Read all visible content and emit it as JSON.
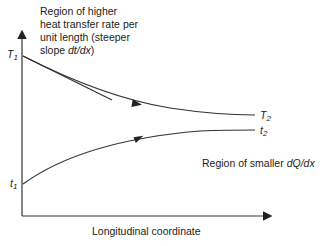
{
  "diagram": {
    "annotation_top": {
      "lines": [
        "Region of higher",
        "heat transfer rate per",
        "unit length (steeper"
      ],
      "line4_prefix": "slope ",
      "line4_italic": "dt/dx",
      "line4_suffix": ")"
    },
    "annotation_right": {
      "prefix": "Region of smaller ",
      "italic": "dQ/dx"
    },
    "x_axis_label": "Longitudinal coordinate",
    "curves": {
      "hot_start": {
        "symbol": "T",
        "sub": "1"
      },
      "hot_end": {
        "symbol": "T",
        "sub": "2"
      },
      "cold_start": {
        "symbol": "t",
        "sub": "1"
      },
      "cold_end": {
        "symbol": "t",
        "sub": "2"
      }
    },
    "colors": {
      "line": "#333333",
      "text": "#222222"
    }
  }
}
